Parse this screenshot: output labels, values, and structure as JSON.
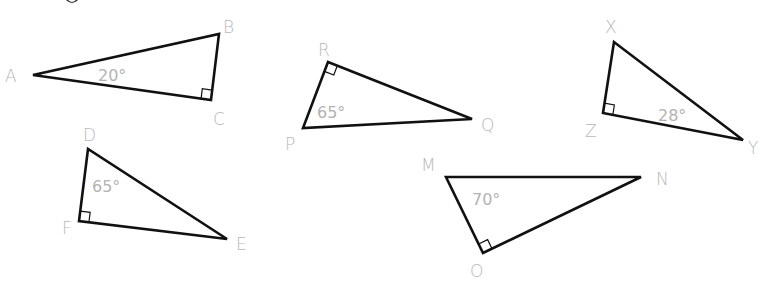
{
  "colors": {
    "edge": "#111111",
    "label": "#b8b8b8",
    "background": "#ffffff"
  },
  "triangles": [
    {
      "id": "ABC",
      "vertices": [
        {
          "name": "A",
          "x": 33,
          "y": 75,
          "lx": 5,
          "ly": 82
        },
        {
          "name": "B",
          "x": 219,
          "y": 34,
          "lx": 223,
          "ly": 33
        },
        {
          "name": "C",
          "x": 211,
          "y": 100,
          "lx": 213,
          "ly": 125
        }
      ],
      "angle": {
        "text": "20°",
        "x": 98,
        "y": 81,
        "at": "A"
      },
      "right_angle_at": "C"
    },
    {
      "id": "PQR",
      "vertices": [
        {
          "name": "R",
          "x": 328,
          "y": 62,
          "lx": 318,
          "ly": 56
        },
        {
          "name": "Q",
          "x": 472,
          "y": 119,
          "lx": 481,
          "ly": 131
        },
        {
          "name": "P",
          "x": 303,
          "y": 128,
          "lx": 285,
          "ly": 150
        }
      ],
      "angle": {
        "text": "65°",
        "x": 317,
        "y": 118,
        "at": "P"
      },
      "right_angle_at": "R"
    },
    {
      "id": "XYZ",
      "vertices": [
        {
          "name": "X",
          "x": 614,
          "y": 42,
          "lx": 605,
          "ly": 33
        },
        {
          "name": "Z",
          "x": 603,
          "y": 113,
          "lx": 585,
          "ly": 137
        },
        {
          "name": "Y",
          "x": 743,
          "y": 140,
          "lx": 748,
          "ly": 154
        }
      ],
      "angle": {
        "text": "28°",
        "x": 658,
        "y": 121,
        "at": "Y"
      },
      "right_angle_at": "Z"
    },
    {
      "id": "DEF",
      "vertices": [
        {
          "name": "D",
          "x": 88,
          "y": 149,
          "lx": 83,
          "ly": 141
        },
        {
          "name": "F",
          "x": 79,
          "y": 221,
          "lx": 62,
          "ly": 234
        },
        {
          "name": "E",
          "x": 227,
          "y": 239,
          "lx": 236,
          "ly": 250
        }
      ],
      "angle": {
        "text": "65°",
        "x": 92,
        "y": 192,
        "at": "D"
      },
      "right_angle_at": "F"
    },
    {
      "id": "MNO",
      "vertices": [
        {
          "name": "M",
          "x": 446,
          "y": 177,
          "lx": 421,
          "ly": 171
        },
        {
          "name": "N",
          "x": 641,
          "y": 177,
          "lx": 656,
          "ly": 185
        },
        {
          "name": "O",
          "x": 483,
          "y": 253,
          "lx": 470,
          "ly": 277
        }
      ],
      "angle": {
        "text": "70°",
        "x": 472,
        "y": 205,
        "at": "M"
      },
      "right_angle_at": "O"
    }
  ]
}
